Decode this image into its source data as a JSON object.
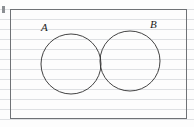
{
  "figure": {
    "kind": "venn-diagram",
    "title": "",
    "background": "#fdfdfd",
    "ruled_paper": true,
    "ruled_line_color": "#c4c8ce",
    "ruled_line_spacing_px": 10
  },
  "universal_set": {
    "name": "universal-set-rectangle",
    "label": "",
    "stroke": "#6f7276",
    "fill": "none",
    "x": 10,
    "y": 9,
    "width": 176,
    "height": 109
  },
  "margin_mark": {
    "name": "margin-tick",
    "color": "#8c8f93"
  },
  "sets": [
    {
      "id": "A",
      "label": "A",
      "name": "circle-a",
      "cx": 71,
      "cy": 64,
      "r": 30,
      "stroke": "#2e2e2e",
      "fill": "none",
      "label_x": 41,
      "label_y": 22
    },
    {
      "id": "B",
      "label": "B",
      "name": "circle-b",
      "cx": 130,
      "cy": 61,
      "r": 30,
      "stroke": "#2e2e2e",
      "fill": "none",
      "label_x": 150,
      "label_y": 19
    }
  ],
  "intersection": {
    "name": "intersection-region",
    "shaded": true,
    "hatch_style": "diagonal",
    "hatch_color": "#dfe2e6",
    "label": ""
  }
}
